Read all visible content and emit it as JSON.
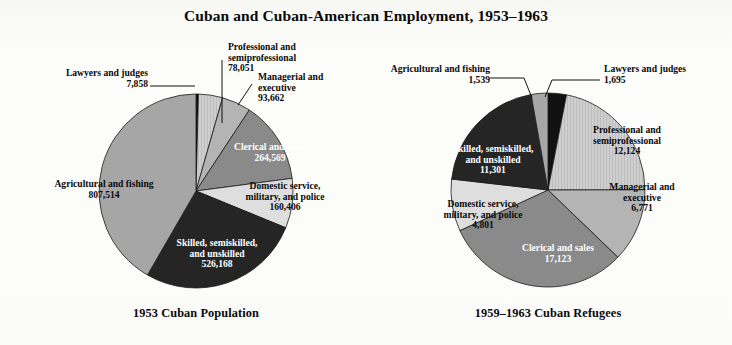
{
  "title": "Cuban and Cuban-American Employment, 1953–1963",
  "chart_data": {
    "type": "pie",
    "title": "Cuban and Cuban-American Employment, 1953–1963",
    "xlabel": "",
    "ylabel": "",
    "legend": "none",
    "grid": false,
    "note": "Two side-by-side pie charts comparing occupational distribution. Slices ordered clockwise starting at 12 o'clock.",
    "charts": [
      {
        "subtitle": "1953 Cuban Population",
        "total": 1938238,
        "categories": [
          "Lawyers and judges",
          "Professional and semiprofessional",
          "Managerial and executive",
          "Clerical and sales",
          "Domestic service, military, and police",
          "Skilled, semiskilled, and unskilled",
          "Agricultural and fishing"
        ],
        "values": [
          7858,
          78051,
          93662,
          264569,
          160406,
          526168,
          807514
        ],
        "value_labels": [
          "7,858",
          "78,051",
          "93,662",
          "264,569",
          "160,406",
          "526,168",
          "807,514"
        ],
        "colors": [
          "#111111",
          "#c9c9c9",
          "#b4b4b4",
          "#8a8a8a",
          "#dedede",
          "#252525",
          "#a6a6a6"
        ]
      },
      {
        "subtitle": "1959–1963 Cuban Refugees",
        "total": 55354,
        "categories": [
          "Lawyers and judges",
          "Professional and semiprofessional",
          "Managerial and executive",
          "Clerical and sales",
          "Domestic service, military, and police",
          "Skilled, semiskilled, and unskilled",
          "Agricultural and fishing"
        ],
        "values": [
          1695,
          12124,
          6771,
          17123,
          4801,
          11301,
          1539
        ],
        "value_labels": [
          "1,695",
          "12,124",
          "6,771",
          "17,123",
          "4,801",
          "11,301",
          "1,539"
        ],
        "colors": [
          "#111111",
          "#c9c9c9",
          "#b4b4b4",
          "#8a8a8a",
          "#dedede",
          "#252525",
          "#a6a6a6"
        ]
      }
    ]
  },
  "left": {
    "caption": "1953 Cuban Population",
    "labels": {
      "lawyers_name": "Lawyers and judges",
      "lawyers_value": "7,858",
      "professional_line1": "Professional and",
      "professional_line2": "semiprofessional",
      "professional_value": "78,051",
      "managerial_line1": "Managerial and",
      "managerial_line2": "executive",
      "managerial_value": "93,662",
      "clerical_name": "Clerical and sales",
      "clerical_value": "264,569",
      "domestic_line1": "Domestic service,",
      "domestic_line2": "military, and police",
      "domestic_value": "160,406",
      "skilled_line1": "Skilled, semiskilled,",
      "skilled_line2": "and unskilled",
      "skilled_value": "526,168",
      "agricultural_name": "Agricultural and fishing",
      "agricultural_value": "807,514"
    }
  },
  "right": {
    "caption": "1959–1963 Cuban Refugees",
    "labels": {
      "lawyers_name": "Lawyers and judges",
      "lawyers_value": "1,695",
      "agricultural_name": "Agricultural and fishing",
      "agricultural_value": "1,539",
      "professional_line1": "Professional and",
      "professional_line2": "semiprofessional",
      "professional_value": "12,124",
      "managerial_line1": "Managerial and",
      "managerial_line2": "executive",
      "managerial_value": "6,771",
      "clerical_name": "Clerical and sales",
      "clerical_value": "17,123",
      "domestic_line1": "Domestic service,",
      "domestic_line2": "military, and police",
      "domestic_value": "4,801",
      "skilled_line1": "Skilled, semiskilled,",
      "skilled_line2": "and unskilled",
      "skilled_value": "11,301"
    }
  }
}
